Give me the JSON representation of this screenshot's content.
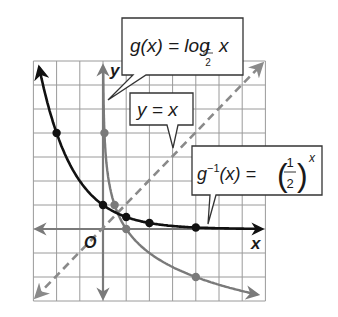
{
  "chart_data": {
    "type": "line",
    "title": "",
    "xlabel": "x",
    "ylabel": "y",
    "origin_label": "O",
    "grid": true,
    "xlim": [
      -3,
      7
    ],
    "ylim": [
      -3,
      7
    ],
    "series": [
      {
        "name": "g^-1(x) = (1/2)^x",
        "color": "#111111",
        "style": "solid",
        "points": [
          [
            -2,
            4
          ],
          [
            0,
            1
          ],
          [
            1,
            0.5
          ],
          [
            2,
            0.25
          ],
          [
            4,
            0.0625
          ]
        ]
      },
      {
        "name": "g(x) = log_1/2 x",
        "color": "#7a7a7a",
        "style": "solid",
        "points": [
          [
            0.0625,
            4
          ],
          [
            0.5,
            1
          ],
          [
            1,
            0
          ],
          [
            4,
            -2
          ]
        ]
      },
      {
        "name": "y = x",
        "color": "#8a8a8a",
        "style": "dashed",
        "points": [
          [
            -3,
            -3
          ],
          [
            7,
            7
          ]
        ]
      }
    ],
    "annotations": [
      {
        "id": "g",
        "text_main": "g(x) = log",
        "subscript_num": "1",
        "subscript_den": "2",
        "text_tail": "x"
      },
      {
        "id": "yx",
        "text": "y = x"
      },
      {
        "id": "ginv",
        "text_main": "g⁻¹(x) =",
        "frac_num": "1",
        "frac_den": "2",
        "exponent": "x"
      }
    ]
  },
  "labels": {
    "x_axis": "x",
    "y_axis": "y",
    "origin": "O",
    "callout_g": {
      "prefix": "g(x) = log",
      "sub_num": "1",
      "sub_den": "2",
      "suffix": "x"
    },
    "callout_yx": "y = x",
    "callout_ginv": {
      "prefix": "g",
      "sup": "−1",
      "mid": "(x) =",
      "num": "1",
      "den": "2",
      "exp": "x"
    }
  }
}
